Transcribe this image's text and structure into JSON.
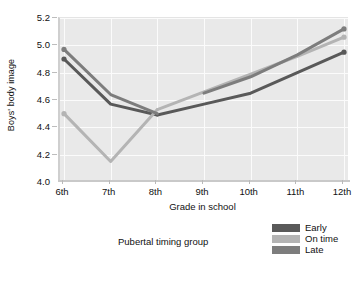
{
  "chart_data": {
    "type": "line",
    "title": "",
    "xlabel": "Grade in school",
    "ylabel": "Boys' body image",
    "categories": [
      "6th",
      "7th",
      "8th",
      "9th",
      "10th",
      "11th",
      "12th"
    ],
    "x": [
      6,
      7,
      8,
      9,
      10,
      11,
      12
    ],
    "ylim": [
      4.0,
      5.2
    ],
    "yticks": [
      "4.0",
      "4.2",
      "4.4",
      "4.6",
      "4.8",
      "5.0",
      "5.2"
    ],
    "ytick_values": [
      4.0,
      4.2,
      4.4,
      4.6,
      4.8,
      5.0,
      5.2
    ],
    "grid": true,
    "legend_position": "bottom-right",
    "legend_title": "Pubertal timing group",
    "series": [
      {
        "name": "Early",
        "color": "#595959",
        "values": [
          4.9,
          4.57,
          4.49,
          4.57,
          4.65,
          4.8,
          4.95
        ],
        "segment_break_at": "8th",
        "values_pre": [
          4.9,
          4.57,
          4.49
        ],
        "values_post": [
          4.49,
          4.57,
          4.65,
          4.8,
          4.95
        ]
      },
      {
        "name": "On time",
        "color": "#b4b4b4",
        "values": [
          4.5,
          4.15,
          4.53,
          4.66,
          4.79,
          4.92,
          5.06
        ],
        "segment_break_at": "8th",
        "values_pre": [
          4.5,
          4.15,
          4.53
        ],
        "values_post": [
          4.53,
          4.66,
          4.79,
          4.92,
          5.06
        ]
      },
      {
        "name": "Late",
        "color": "#7d7d7d",
        "values": [
          4.97,
          4.64,
          4.5,
          4.65,
          4.77,
          4.93,
          5.12
        ],
        "segment_break_at": "8th",
        "values_pre": [
          4.97,
          4.64,
          4.5
        ],
        "values_post": [
          4.65,
          4.77,
          4.93,
          5.12
        ]
      }
    ],
    "markers": true,
    "background_color": "#e9e9e9",
    "gridline_color": "#fbfbfb"
  },
  "axes": {
    "y_title": "Boys' body image",
    "x_title": "Grade in school"
  },
  "legend": {
    "title": "Pubertal timing group",
    "entries": [
      {
        "label": "Early",
        "color": "#595959"
      },
      {
        "label": "On time",
        "color": "#b4b4b4"
      },
      {
        "label": "Late",
        "color": "#7d7d7d"
      }
    ]
  }
}
